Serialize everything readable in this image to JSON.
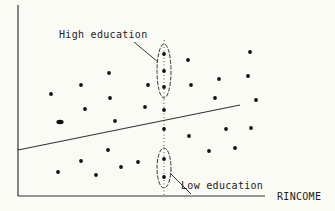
{
  "chart_data": {
    "type": "scatter",
    "title": "",
    "xlabel": "RINCOME",
    "ylabel": "",
    "grid": false,
    "legend": null,
    "x_ticks": [],
    "y_ticks": [],
    "points_px": [
      [
        51,
        94
      ],
      [
        81,
        85
      ],
      [
        109,
        73
      ],
      [
        110,
        98
      ],
      [
        85,
        109
      ],
      [
        115,
        121
      ],
      [
        148,
        85
      ],
      [
        145,
        107
      ],
      [
        164,
        54
      ],
      [
        164,
        71
      ],
      [
        164,
        87
      ],
      [
        164,
        110
      ],
      [
        164,
        129
      ],
      [
        164,
        159
      ],
      [
        164,
        177
      ],
      [
        188,
        60
      ],
      [
        191,
        85
      ],
      [
        250,
        52
      ],
      [
        219,
        79
      ],
      [
        248,
        76
      ],
      [
        215,
        98
      ],
      [
        256,
        100
      ],
      [
        226,
        129
      ],
      [
        251,
        128
      ],
      [
        189,
        136
      ],
      [
        209,
        151
      ],
      [
        235,
        148
      ],
      [
        58,
        172
      ],
      [
        81,
        161
      ],
      [
        108,
        150
      ],
      [
        96,
        175
      ],
      [
        121,
        167
      ],
      [
        138,
        162
      ]
    ],
    "large_point_px": [
      60,
      122
    ],
    "regression_line_px": [
      [
        18,
        150
      ],
      [
        240,
        105
      ]
    ],
    "vertical_reference_line_px_x": 164,
    "annotations": [
      {
        "text": "High education",
        "target": "upper ellipse of points on vertical line"
      },
      {
        "text": "Low education",
        "target": "lower ellipse of points on vertical line"
      }
    ]
  },
  "labels": {
    "high": "High education",
    "low": "Low education",
    "xaxis": "RINCOME"
  }
}
